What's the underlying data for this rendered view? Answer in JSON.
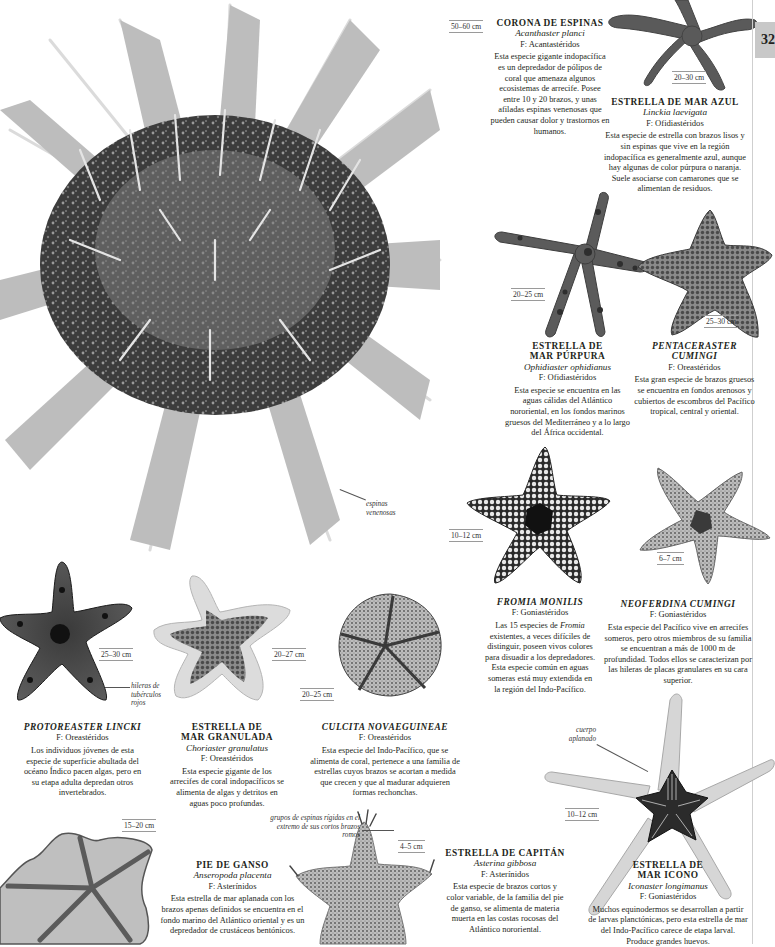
{
  "page": {
    "number_tab": "32",
    "accent_tab_color": "#c8c8c8"
  },
  "species": [
    {
      "id": "corona-de-espinas",
      "title": "CORONA DE ESPINAS",
      "scientific": "Acanthaster planci",
      "family_prefix": "F:",
      "family": "Acantastéridos",
      "size": "50–60 cm",
      "description": "Esta especie gigante indopacífica es un depredador de pólipos de coral que amenaza algunos ecosistemas de arrecife. Posee entre 10 y 20 brazos, y unas afiladas espinas venenosas que pueden causar dolor y trastornos en humanos.",
      "annotation": "espinas venenosas"
    },
    {
      "id": "estrella-de-mar-azul",
      "title": "ESTRELLA DE MAR AZUL",
      "scientific": "Linckia laevigata",
      "family_prefix": "F:",
      "family": "Ofidiastéridos",
      "size": "20–30 cm",
      "description": "Esta especie de estrella con brazos lisos y sin espinas que vive en la región indopacífica es generalmente azul, aunque hay algunas de color púrpura o naranja. Suele asociarse con camarones que se alimentan de residuos."
    },
    {
      "id": "estrella-de-mar-purpura",
      "title": "ESTRELLA DE\nMAR PÚRPURA",
      "scientific": "Ophidiaster ophidianus",
      "family_prefix": "F:",
      "family": "Ofidiastéridos",
      "size": "20–25 cm",
      "description": "Esta especie se encuentra en las aguas cálidas del Atlántico nororiental, en los fondos marinos gruesos del Mediterráneo y a lo largo del África occidental."
    },
    {
      "id": "pentaceraster-cumingi",
      "title": "PENTACERASTER\nCUMINGI",
      "scientific": "",
      "family_prefix": "F:",
      "family": "Oreastéridos",
      "size": "25–30 cm",
      "description": "Esta gran especie de brazos gruesos se encuentra en fondos arenosos y cubiertos de escombros del Pacífico tropical, central y oriental."
    },
    {
      "id": "fromia-monilis",
      "title": "FROMIA MONILIS",
      "scientific": "",
      "family_prefix": "F:",
      "family": "Goniastéridos",
      "size": "10–12 cm",
      "description_parts": [
        "Las 15 especies de ",
        "Fromia",
        " existentes, a veces difíciles de distinguir, poseen vivos colores para disuadir a los depredadores. Esta especie común en aguas someras está muy extendida en la región del Indo-Pacífico."
      ]
    },
    {
      "id": "neoferdina-cumingi",
      "title": "NEOFERDINA CUMINGI",
      "scientific": "",
      "family_prefix": "F:",
      "family": "Goniastéridos",
      "size": "6–7 cm",
      "description": "Esta especie del Pacífico vive en arrecifes someros, pero otros miembros de su familia se encuentran a más de 1000 m de profundidad. Todos ellos se caracterizan por las hileras de placas granulares en su cara superior."
    },
    {
      "id": "protoreaster-lincki",
      "title": "PROTOREASTER LINCKI",
      "scientific": "",
      "family_prefix": "F:",
      "family": "Oreastéridos",
      "size": "25–30 cm",
      "description": "Los individuos jóvenes de esta especie de superficie abultada del océano Índico pacen algas, pero en su etapa adulta depredan otros invertebrados.",
      "annotation": "hileras de tubérculos rojos"
    },
    {
      "id": "estrella-de-mar-granulada",
      "title": "ESTRELLA DE\nMAR GRANULADA",
      "scientific": "Choriaster granulatus",
      "family_prefix": "F:",
      "family": "Oreastéridos",
      "size": "20–27 cm",
      "description": "Esta especie gigante de los arrecifes de coral indopacíficos se alimenta de algas y detritos en aguas poco profundas."
    },
    {
      "id": "culcita-novaeguineae",
      "title": "CULCITA NOVAEGUINEAE",
      "scientific": "",
      "family_prefix": "F:",
      "family": "Oreastéridos",
      "size": "20–25 cm",
      "description": "Esta especie del Indo-Pacífico, que se alimenta de coral, pertenece a una familia de estrellas cuyos brazos se acortan a medida que crecen y que al madurar adquieren formas rechonchas."
    },
    {
      "id": "pie-de-ganso",
      "title": "PIE DE GANSO",
      "scientific": "Anseropoda placenta",
      "family_prefix": "F:",
      "family": "Asterínidos",
      "size": "15–20 cm",
      "description": "Esta estrella de mar aplanada con los brazos apenas definidos se encuentra en el fondo marino del Atlántico oriental y es un depredador de crustáceos bentónicos."
    },
    {
      "id": "estrella-de-capitan",
      "title": "ESTRELLA DE CAPITÁN",
      "scientific": "Asterina gibbosa",
      "family_prefix": "F:",
      "family": "Asterínidos",
      "size": "4–5 cm",
      "description": "Esta especie de brazos cortos y color variable, de la familia del pie de ganso, se alimenta de materia muerta en las costas rocosas del Atlántico nororiental.",
      "annotation": "grupos de espinas rígidas en el extremo de sus cortos brazos romos"
    },
    {
      "id": "estrella-de-mar-icono",
      "title": "ESTRELLA DE\nMAR ICONO",
      "scientific": "Iconaster longimanus",
      "family_prefix": "F:",
      "family": "Goniastéridos",
      "size": "10–12 cm",
      "description": "Muchos equinodermos se desarrollan a partir de larvas planctónicas, pero esta estrella de mar del Indo-Pacífico carece de etapa larval. Produce grandes huevos.",
      "annotation": "cuerpo aplanado"
    }
  ]
}
